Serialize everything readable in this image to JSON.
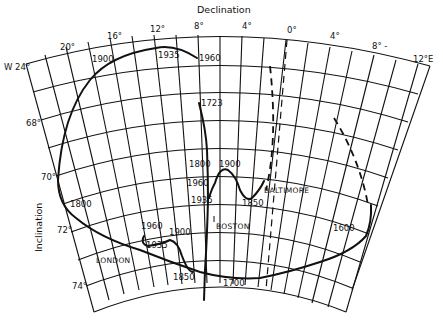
{
  "title": "Declination",
  "y_axis_title": "Inclination",
  "declination_labels": [
    {
      "text": "W 24°",
      "x": 4,
      "y": 70
    },
    {
      "text": "20°",
      "x": 60,
      "y": 50
    },
    {
      "text": "16°",
      "x": 107,
      "y": 39
    },
    {
      "text": "12°",
      "x": 150,
      "y": 32
    },
    {
      "text": "8°",
      "x": 194,
      "y": 29
    },
    {
      "text": "4°",
      "x": 242,
      "y": 29
    },
    {
      "text": "0°",
      "x": 287,
      "y": 33
    },
    {
      "text": "4°",
      "x": 330,
      "y": 39
    },
    {
      "text": "8° -",
      "x": 372,
      "y": 49
    },
    {
      "text": "12°E",
      "x": 413,
      "y": 62
    }
  ],
  "inclination_labels": [
    {
      "text": "68°",
      "x": 26,
      "y": 126
    },
    {
      "text": "70°",
      "x": 41,
      "y": 180
    },
    {
      "text": "72°",
      "x": 57,
      "y": 233
    },
    {
      "text": "74°",
      "x": 72,
      "y": 289
    }
  ],
  "year_labels": [
    {
      "text": "1900",
      "x": 92,
      "y": 62
    },
    {
      "text": "1935",
      "x": 158,
      "y": 58
    },
    {
      "text": "1960",
      "x": 199,
      "y": 61
    },
    {
      "text": "1723",
      "x": 201,
      "y": 106
    },
    {
      "text": "1800",
      "x": 189,
      "y": 167
    },
    {
      "text": "1900",
      "x": 219,
      "y": 167
    },
    {
      "text": "1960",
      "x": 187,
      "y": 186
    },
    {
      "text": "1935",
      "x": 191,
      "y": 203
    },
    {
      "text": "1850",
      "x": 242,
      "y": 206
    },
    {
      "text": "1800",
      "x": 70,
      "y": 207
    },
    {
      "text": "1960",
      "x": 141,
      "y": 229
    },
    {
      "text": "1900",
      "x": 169,
      "y": 235
    },
    {
      "text": "1935",
      "x": 146,
      "y": 248
    },
    {
      "text": "1850",
      "x": 173,
      "y": 280
    },
    {
      "text": "1700",
      "x": 223,
      "y": 286
    },
    {
      "text": "1600",
      "x": 333,
      "y": 231
    }
  ],
  "city_labels": [
    {
      "text": "BALTIMORE",
      "x": 264,
      "y": 193
    },
    {
      "text": "BOSTON",
      "x": 216,
      "y": 229
    },
    {
      "text": "LONDON",
      "x": 96,
      "y": 263
    }
  ]
}
